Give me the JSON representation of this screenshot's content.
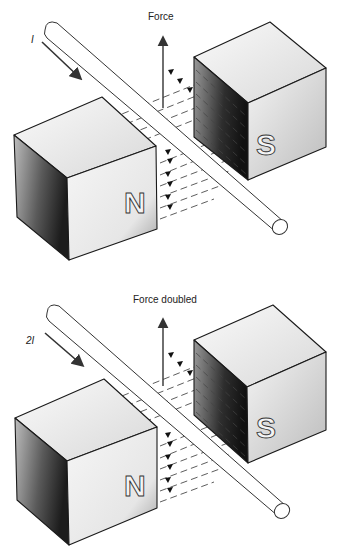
{
  "panels": [
    {
      "id": "single-current",
      "force_label": "Force",
      "current_label": "I",
      "north_label": "N",
      "south_label": "S"
    },
    {
      "id": "double-current",
      "force_label": "Force doubled",
      "current_label": "2I",
      "north_label": "N",
      "south_label": "S"
    }
  ],
  "colors": {
    "outline": "#1a1a1a",
    "shade_dark": "#3a3a3a",
    "shade_light": "#f2f2f2",
    "background": "#ffffff"
  }
}
